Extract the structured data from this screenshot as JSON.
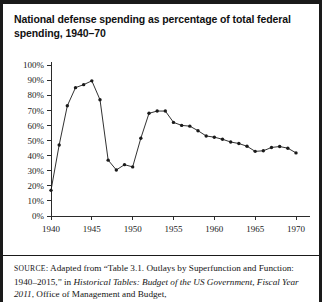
{
  "figure": {
    "title": "National defense spending as percentage of total federal spending, 1940–70"
  },
  "source": {
    "label": "SOURCE",
    "colon": ": ",
    "part1": "Adapted from “Table 3.1. Outlays by Superfunction and Function: 1940–2015,” in ",
    "italic1": "Historical Tables: Budget of the US Government, Fiscal Year 2011",
    "part2": ", Office of Management and Budget,"
  },
  "chart_data": {
    "type": "line",
    "title": "National defense spending as percentage of total federal spending, 1940–70",
    "xlabel": "",
    "ylabel": "",
    "xlim": [
      1939,
      1971
    ],
    "ylim": [
      0,
      100
    ],
    "grid": false,
    "legend": false,
    "marker": "filled-circle",
    "y_tick_labels": [
      "0%",
      "10%",
      "20%",
      "30%",
      "40%",
      "50%",
      "60%",
      "70%",
      "80%",
      "90%",
      "100%"
    ],
    "y_ticks": [
      0,
      10,
      20,
      30,
      40,
      50,
      60,
      70,
      80,
      90,
      100
    ],
    "x_tick_labels": [
      "1940",
      "1945",
      "1950",
      "1955",
      "1960",
      "1965",
      "1970"
    ],
    "x_ticks": [
      1940,
      1945,
      1950,
      1955,
      1960,
      1965,
      1970
    ],
    "x": [
      1940,
      1941,
      1942,
      1943,
      1944,
      1945,
      1946,
      1947,
      1948,
      1949,
      1950,
      1951,
      1952,
      1953,
      1954,
      1955,
      1956,
      1957,
      1958,
      1959,
      1960,
      1961,
      1962,
      1963,
      1964,
      1965,
      1966,
      1967,
      1968,
      1969,
      1970
    ],
    "values": [
      17.0,
      47.0,
      73.0,
      85.0,
      87.0,
      89.5,
      77.0,
      37.0,
      30.5,
      34.0,
      32.5,
      51.5,
      68.0,
      69.5,
      69.5,
      62.0,
      60.0,
      59.5,
      56.5,
      53.0,
      52.2,
      50.8,
      49.0,
      48.0,
      46.2,
      42.8,
      43.2,
      45.4,
      46.0,
      44.9,
      41.8
    ],
    "series": [
      {
        "name": "National defense share of federal outlays",
        "values": [
          17.0,
          47.0,
          73.0,
          85.0,
          87.0,
          89.5,
          77.0,
          37.0,
          30.5,
          34.0,
          32.5,
          51.5,
          68.0,
          69.5,
          69.5,
          62.0,
          60.0,
          59.5,
          56.5,
          53.0,
          52.2,
          50.8,
          49.0,
          48.0,
          46.2,
          42.8,
          43.2,
          45.4,
          46.0,
          44.9,
          41.8
        ]
      }
    ],
    "line_color": "#1a1a1a",
    "marker_color": "#1a1a1a"
  }
}
